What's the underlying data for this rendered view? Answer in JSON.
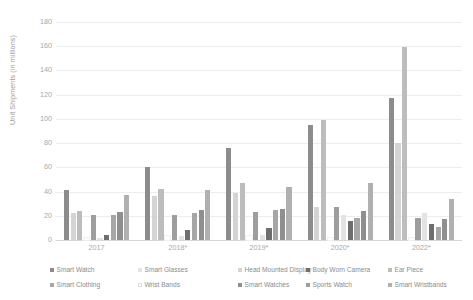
{
  "chart_data": {
    "type": "bar",
    "title": "",
    "xlabel": "",
    "ylabel": "Unit Shipments (in millions)",
    "ylim": [
      0,
      180
    ],
    "yticks": [
      0,
      20,
      40,
      60,
      80,
      100,
      120,
      140,
      160,
      180
    ],
    "grid": true,
    "legend_position": "bottom",
    "categories": [
      "2017",
      "2018*",
      "2019*",
      "2020*",
      "2022*"
    ],
    "series": [
      {
        "name": "Smart Watch",
        "color": "#8c8c8c",
        "values": [
          41,
          60,
          76,
          95,
          117
        ]
      },
      {
        "name": "Head Mounted Display",
        "color": "#d4d4d4",
        "values": [
          22,
          36,
          39,
          27,
          80
        ]
      },
      {
        "name": "Ear Piece",
        "color": "#bdbdbd",
        "values": [
          24,
          42,
          47,
          99,
          159
        ]
      },
      {
        "name": "Wrist Bands",
        "color": "#ffffff",
        "values": [
          2,
          3,
          3,
          2,
          2
        ]
      },
      {
        "name": "Sports Watch",
        "color": "#9e9e9e",
        "values": [
          21,
          21,
          23,
          27,
          18
        ]
      },
      {
        "name": "Smart Glasses",
        "color": "#e3e3e3",
        "values": [
          2,
          3,
          4,
          21,
          22
        ]
      },
      {
        "name": "Body Worn Camera",
        "color": "#6e6e6e",
        "values": [
          4,
          8,
          10,
          16,
          13
        ]
      },
      {
        "name": "Smart Clothing",
        "color": "#a6a6a6",
        "values": [
          21,
          22,
          25,
          18,
          11
        ]
      },
      {
        "name": "Smart Watches",
        "color": "#8f8f8f",
        "values": [
          23,
          25,
          26,
          24,
          17
        ]
      },
      {
        "name": "Smart Wristbands",
        "color": "#b0b0b0",
        "values": [
          37,
          41,
          44,
          47,
          34
        ]
      }
    ]
  },
  "legend": {
    "items": [
      {
        "label": "Smart Watch"
      },
      {
        "label": "Head Mounted Display"
      },
      {
        "label": "Ear Piece"
      },
      {
        "label": "Wrist Bands"
      },
      {
        "label": "Sports Watch"
      },
      {
        "label": "Smart Glasses"
      },
      {
        "label": "Body Worn Camera"
      },
      {
        "label": "Smart Clothing"
      },
      {
        "label": "Smart Watches"
      },
      {
        "label": "Smart Wristbands"
      }
    ]
  }
}
